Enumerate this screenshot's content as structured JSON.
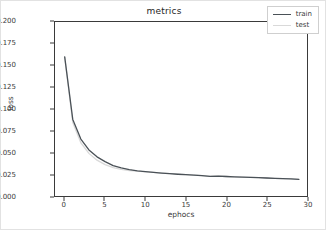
{
  "chart_data": {
    "type": "line",
    "title": "metrics",
    "xlabel": "ephocs",
    "ylabel": "loss",
    "xlim": [
      -1.2,
      30
    ],
    "ylim": [
      0.0,
      0.2
    ],
    "grid": false,
    "legend_position": "upper right",
    "xticks": [
      0,
      5,
      10,
      15,
      20,
      25,
      30
    ],
    "xtick_labels": [
      "0",
      "5",
      "10",
      "15",
      "20",
      "25",
      "30"
    ],
    "yticks": [
      0.0,
      0.025,
      0.05,
      0.075,
      0.1,
      0.125,
      0.15,
      0.175,
      0.2
    ],
    "ytick_labels": [
      "0.000",
      "0.025",
      "0.050",
      "0.075",
      "0.100",
      "0.125",
      "0.150",
      "0.175",
      "0.200"
    ],
    "x": [
      0,
      1,
      2,
      3,
      4,
      5,
      6,
      7,
      8,
      9,
      10,
      11,
      12,
      13,
      14,
      15,
      16,
      17,
      18,
      19,
      20,
      21,
      22,
      23,
      24,
      25,
      26,
      27,
      28,
      29
    ],
    "series": [
      {
        "name": "train",
        "color": "#4a5157",
        "values": [
          0.16,
          0.088,
          0.0655,
          0.053,
          0.045,
          0.0395,
          0.035,
          0.0322,
          0.0303,
          0.029,
          0.028,
          0.0272,
          0.0264,
          0.0257,
          0.025,
          0.0245,
          0.0241,
          0.0234,
          0.0225,
          0.0228,
          0.0224,
          0.022,
          0.0217,
          0.0214,
          0.0211,
          0.0207,
          0.0203,
          0.02,
          0.0196,
          0.0192
        ]
      },
      {
        "name": "test",
        "color": "#d9d9d9",
        "values": [
          0.16,
          0.0845,
          0.0612,
          0.049,
          0.0412,
          0.036,
          0.0325,
          0.0305,
          0.0292,
          0.0285,
          0.0278,
          0.0271,
          0.0263,
          0.0256,
          0.025,
          0.0245,
          0.0241,
          0.0234,
          0.0226,
          0.0229,
          0.0224,
          0.022,
          0.0217,
          0.0214,
          0.0211,
          0.0207,
          0.0203,
          0.02,
          0.0196,
          0.0192
        ]
      }
    ]
  }
}
